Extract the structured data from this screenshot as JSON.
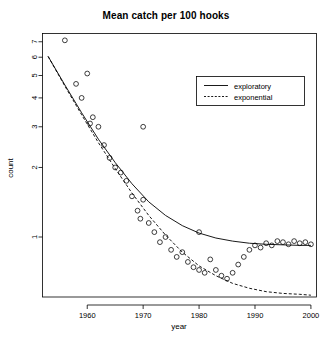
{
  "chart_data": {
    "type": "scatter",
    "title": "Mean catch per 100 hooks",
    "xlabel": "year",
    "ylabel": "count",
    "xlim": [
      1952,
      2001
    ],
    "ylim": [
      0.55,
      7.6
    ],
    "yscale": "log",
    "grid": false,
    "xticks": [
      1960,
      1970,
      1980,
      1990,
      2000
    ],
    "xtick_labels": [
      "1960",
      "1970",
      "1980",
      "1990",
      "2000"
    ],
    "yticks": [
      1,
      2,
      3,
      4,
      5,
      6,
      7
    ],
    "ytick_labels": [
      "1",
      "2",
      "3",
      "4",
      "5",
      "6",
      "7"
    ],
    "legend": {
      "position": "top-right",
      "entries": [
        {
          "label": "exploratory",
          "style": "solid"
        },
        {
          "label": "exponential",
          "style": "dashed"
        }
      ]
    },
    "points": {
      "marker": "open-circle",
      "x": [
        1956,
        1958,
        1959,
        1960,
        1960.5,
        1961,
        1962,
        1963,
        1964,
        1965,
        1966,
        1967,
        1968,
        1969,
        1969.5,
        1970,
        1971,
        1972,
        1973,
        1974,
        1975,
        1976,
        1977,
        1978,
        1979,
        1980,
        1981,
        1982,
        1983,
        1984,
        1985,
        1986,
        1987,
        1988,
        1989,
        1990,
        1991,
        1992,
        1993,
        1994,
        1995,
        1996,
        1997,
        1998,
        1999,
        2000
      ],
      "y": [
        7.1,
        4.6,
        4.0,
        5.1,
        3.1,
        3.3,
        3.0,
        2.5,
        2.2,
        2.0,
        1.9,
        1.75,
        1.5,
        1.3,
        1.2,
        1.45,
        1.15,
        1.05,
        0.95,
        1.0,
        0.88,
        0.82,
        0.86,
        0.78,
        0.74,
        0.72,
        0.7,
        0.8,
        0.72,
        0.68,
        0.66,
        0.7,
        0.76,
        0.82,
        0.88,
        0.92,
        0.9,
        0.94,
        0.92,
        0.96,
        0.95,
        0.93,
        0.96,
        0.94,
        0.95,
        0.93
      ],
      "outliers_x": [
        1970,
        1980
      ],
      "outliers_y": [
        3.0,
        1.05
      ]
    },
    "curves": [
      {
        "name": "exploratory",
        "style": "solid",
        "x": [
          1953,
          1956,
          1959,
          1962,
          1965,
          1968,
          1971,
          1974,
          1977,
          1980,
          1983,
          1986,
          1989,
          1992,
          1995,
          1998,
          2000
        ],
        "y": [
          6.05,
          4.55,
          3.45,
          2.65,
          2.1,
          1.7,
          1.42,
          1.24,
          1.12,
          1.04,
          0.99,
          0.96,
          0.94,
          0.93,
          0.925,
          0.92,
          0.92
        ]
      },
      {
        "name": "exponential",
        "style": "dashed",
        "x": [
          1953,
          1956,
          1959,
          1962,
          1965,
          1968,
          1971,
          1974,
          1977,
          1980,
          1983,
          1986,
          1989,
          1992,
          1995,
          1998,
          2000
        ],
        "y": [
          6.05,
          4.5,
          3.38,
          2.56,
          1.98,
          1.55,
          1.24,
          1.02,
          0.86,
          0.75,
          0.68,
          0.63,
          0.6,
          0.58,
          0.57,
          0.565,
          0.56
        ]
      }
    ]
  }
}
